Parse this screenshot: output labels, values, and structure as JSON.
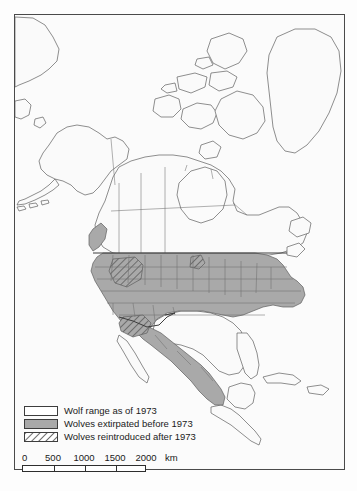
{
  "figure": {
    "kind": "thematic-map",
    "region": "North America",
    "background_color": "#fdfdfd",
    "frame_color": "#4a4a4a"
  },
  "map": {
    "land_default_fill": "#fafafa",
    "shaded_fill": "#a9a9a9",
    "hatch_stroke": "#6a6a6a",
    "outline_color": "#555555",
    "border_color": "#3c3c3c",
    "ocean_fill": "#fbfbfb"
  },
  "legend": {
    "items": [
      {
        "swatch": "white-box",
        "label": "Wolf range as of 1973"
      },
      {
        "swatch": "gray-box",
        "label": "Wolves extirpated before 1973"
      },
      {
        "swatch": "hatched-box",
        "label": "Wolves reintroduced after 1973"
      }
    ]
  },
  "scalebar": {
    "ticks": [
      "0",
      "500",
      "1000",
      "1500",
      "2000"
    ],
    "unit": "km",
    "tick_positions_px": [
      0,
      31,
      62,
      93,
      124
    ],
    "bar_width_px": 124
  }
}
